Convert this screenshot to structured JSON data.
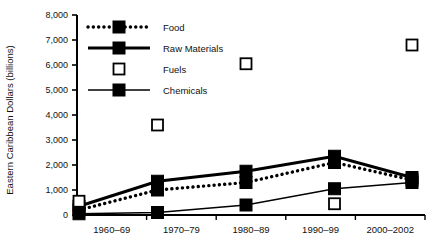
{
  "figure": {
    "clipped_header_text": "",
    "background_color": "#ffffff",
    "ink_color": "#000000"
  },
  "chart_data": {
    "type": "line",
    "title": "",
    "xlabel": "",
    "ylabel": "Eastern Caribbean Dollars (billions)",
    "categories": [
      "1960–69",
      "1970–79",
      "1980–89",
      "1990–99",
      "2000–2002"
    ],
    "ylim": [
      0,
      8000
    ],
    "ytick_values": [
      0,
      1000,
      2000,
      3000,
      4000,
      5000,
      6000,
      7000,
      8000
    ],
    "ytick_labels": [
      "0",
      "1,000",
      "2,000",
      "3,000",
      "4,000",
      "5,000",
      "6,000",
      "7,000",
      "8,000"
    ],
    "grid": false,
    "legend_position": "upper-left-inside",
    "series": [
      {
        "name": "Food",
        "marker": "filled-square",
        "line_style": "dotted",
        "line_width": 3,
        "color": "#000000",
        "values": [
          200,
          1000,
          1300,
          2100,
          1400
        ]
      },
      {
        "name": "Raw Materials",
        "marker": "filled-square",
        "line_style": "solid",
        "line_width": 3,
        "color": "#000000",
        "values": [
          350,
          1350,
          1750,
          2350,
          1500
        ]
      },
      {
        "name": "Fuels",
        "marker": "open-square",
        "line_style": "none",
        "line_width": 0,
        "color": "#000000",
        "values": [
          550,
          3600,
          6050,
          450,
          6800
        ]
      },
      {
        "name": "Chemicals",
        "marker": "filled-square",
        "line_style": "solid",
        "line_width": 1.3,
        "color": "#000000",
        "values": [
          50,
          100,
          400,
          1050,
          1300
        ]
      }
    ]
  }
}
